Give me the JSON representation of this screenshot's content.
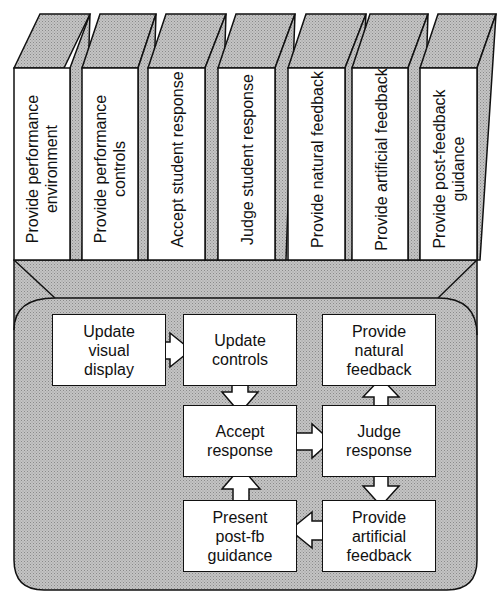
{
  "diagram": {
    "fill_color": "#b3b3b3",
    "stroke_color": "#111111",
    "books": [
      {
        "label": "Provide performance environment"
      },
      {
        "label": "Provide performance controls"
      },
      {
        "label": "Accept student response"
      },
      {
        "label": "Judge student response"
      },
      {
        "label": "Provide natural feedback"
      },
      {
        "label": "Provide artificial feedback"
      },
      {
        "label": "Provide post-feedback guidance"
      }
    ],
    "boxes": {
      "update_visual_display": "Update visual display",
      "update_controls": "Update controls",
      "provide_natural_feedback": "Provide natural feedback",
      "accept_response": "Accept response",
      "judge_response": "Judge response",
      "present_post_fb_guidance": "Present post-fb guidance",
      "provide_artificial_feedback": "Provide artificial feedback"
    },
    "arrows": [
      {
        "from": "Update visual display",
        "to": "Update controls",
        "direction": "right"
      },
      {
        "from": "Update controls",
        "to": "Accept response",
        "direction": "down"
      },
      {
        "from": "Accept response",
        "to": "Judge response",
        "direction": "right"
      },
      {
        "from": "Judge response",
        "to": "Provide natural feedback",
        "direction": "up"
      },
      {
        "from": "Judge response",
        "to": "Provide artificial feedback",
        "direction": "down"
      },
      {
        "from": "Provide artificial feedback",
        "to": "Present post-fb guidance",
        "direction": "left"
      },
      {
        "from": "Present post-fb guidance",
        "to": "Accept response",
        "direction": "up"
      }
    ]
  }
}
